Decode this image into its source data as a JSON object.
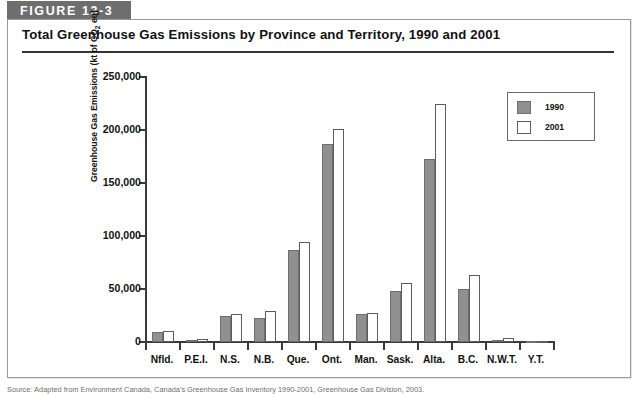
{
  "figure": {
    "tag_label": "FIGURE 13-3",
    "title": "Total Greenhouse Gas Emissions by Province and Territory, 1990 and 2001"
  },
  "colors": {
    "tag_background": "#6e6e6e",
    "series_1990": "#909090",
    "series_2001": "#ffffff",
    "axis": "#3a3a3a",
    "frame_border": "#9a9a9a"
  },
  "legend": {
    "position": "top-right",
    "entries": [
      {
        "label": "1990",
        "swatch": "series_1990"
      },
      {
        "label": "2001",
        "swatch": "series_2001"
      }
    ]
  },
  "source_note": {
    "text": "Source: Adapted from Environment Canada, Canada's Greenhouse Gas Inventory 1990-2001, Greenhouse Gas Division, 2003."
  },
  "chart_data": {
    "type": "bar",
    "title": "Total Greenhouse Gas Emissions by Province and Territory, 1990 and 2001",
    "xlabel": "",
    "ylabel": "Greenhouse Gas Emissions (kt of CO2 eq)",
    "ylabel_display": "Greenhouse Gas Emissions (kt of CO",
    "ylabel_sub": "2",
    "ylabel_tail": " eq)",
    "ylim": [
      0,
      250000
    ],
    "ytick_values": [
      0,
      50000,
      100000,
      150000,
      200000,
      250000
    ],
    "ytick_labels": [
      "0",
      "50,000",
      "100,000",
      "150,000",
      "200,000",
      "250,000"
    ],
    "grid": false,
    "categories": [
      "Nfld.",
      "P.E.I.",
      "N.S.",
      "N.B.",
      "Que.",
      "Ont.",
      "Man.",
      "Sask.",
      "Alta.",
      "B.C.",
      "N.W.T.",
      "Y.T."
    ],
    "series": [
      {
        "name": "1990",
        "values": [
          9000,
          2000,
          25000,
          23000,
          87000,
          187000,
          26000,
          48000,
          173000,
          50000,
          1500,
          500
        ]
      },
      {
        "name": "2001",
        "values": [
          10000,
          3000,
          26000,
          29000,
          94000,
          201000,
          27000,
          56000,
          225000,
          63000,
          4000,
          600
        ]
      }
    ]
  }
}
